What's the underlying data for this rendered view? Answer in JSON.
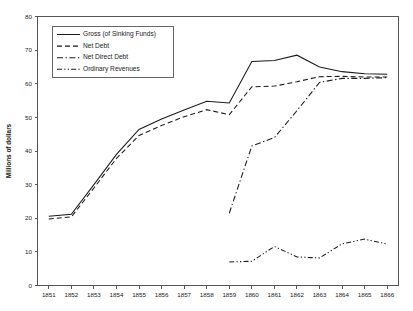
{
  "chart_data": {
    "type": "line",
    "title": "",
    "xlabel": "",
    "ylabel": "Millions of dollars",
    "x": [
      1851,
      1852,
      1853,
      1854,
      1855,
      1856,
      1857,
      1858,
      1859,
      1860,
      1861,
      1862,
      1863,
      1864,
      1865,
      1866
    ],
    "xtick_labels": [
      "1851",
      "1852",
      "1853",
      "1854",
      "1855",
      "1856",
      "1857",
      "1858",
      "1859",
      "1860",
      "1861",
      "1862",
      "1863",
      "1864",
      "1865",
      "1866"
    ],
    "ytick_labels": [
      "0",
      "10",
      "20",
      "30",
      "40",
      "50",
      "60",
      "70",
      "80"
    ],
    "yticks": [
      0,
      10,
      20,
      30,
      40,
      50,
      60,
      70,
      80
    ],
    "ylim": [
      0,
      80
    ],
    "grid": false,
    "legend_position": "upper-left",
    "series": [
      {
        "name": "Gross (of Sinking Funds)",
        "dash": "solid",
        "x": [
          1851,
          1852,
          1853,
          1854,
          1855,
          1856,
          1857,
          1858,
          1859,
          1860,
          1861,
          1862,
          1863,
          1864,
          1865,
          1866
        ],
        "values": [
          20.6,
          21.2,
          30.0,
          39.0,
          46.4,
          49.5,
          52.2,
          54.8,
          54.3,
          66.6,
          66.9,
          68.5,
          65.0,
          63.6,
          63.0,
          62.8
        ]
      },
      {
        "name": "Net Debt",
        "dash": "dashed",
        "x": [
          1851,
          1852,
          1853,
          1854,
          1855,
          1856,
          1857,
          1858,
          1859,
          1860,
          1861,
          1862,
          1863,
          1864,
          1865,
          1866
        ],
        "values": [
          19.8,
          20.4,
          29.0,
          37.8,
          44.6,
          47.6,
          50.2,
          52.3,
          50.8,
          59.1,
          59.3,
          60.6,
          62.1,
          62.2,
          62.0,
          62.0
        ]
      },
      {
        "name": "Net Direct Debt",
        "dash": "dashdot",
        "x": [
          1859,
          1860,
          1861,
          1862,
          1863,
          1864,
          1865,
          1866
        ],
        "values": [
          21.5,
          41.5,
          44.0,
          52.0,
          60.4,
          61.6,
          61.6,
          61.8
        ]
      },
      {
        "name": "Ordinary Revenues",
        "dash": "dashdotdot",
        "x": [
          1859,
          1860,
          1861,
          1862,
          1863,
          1864,
          1865,
          1866
        ],
        "values": [
          7.0,
          7.2,
          11.6,
          8.5,
          8.2,
          12.4,
          13.8,
          12.3
        ]
      }
    ]
  },
  "axis": {
    "ylabel": "Millions of dollars"
  }
}
